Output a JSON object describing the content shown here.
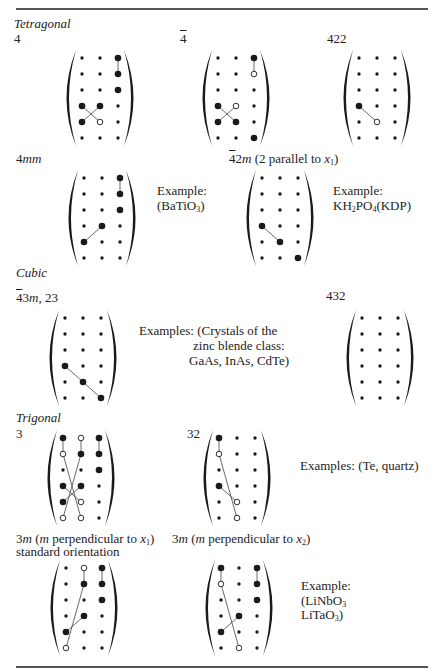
{
  "rules": {
    "color": "#555555",
    "top_y": 8,
    "bottom_y": 666,
    "x1": 16,
    "x2": 428
  },
  "sections": {
    "tetragonal": {
      "title": "Tetragonal"
    },
    "cubic": {
      "title": "Cubic"
    },
    "trigonal": {
      "title": "Trigonal"
    }
  },
  "labels": {
    "c4": [
      {
        "t": "4"
      }
    ],
    "c4bar": [
      {
        "t": "4",
        "bar": true
      }
    ],
    "c422": [
      {
        "t": "422"
      }
    ],
    "c4mm": [
      {
        "t": "4"
      },
      {
        "t": "mm",
        "i": true
      }
    ],
    "c42m": [
      {
        "t": "4",
        "bar": true
      },
      {
        "t": "2"
      },
      {
        "t": "m",
        "i": true
      },
      {
        "t": " (2 parallel to "
      },
      {
        "t": "x",
        "i": true
      },
      {
        "t": "1",
        "sub": true
      },
      {
        "t": ")"
      }
    ],
    "c43m": [
      {
        "t": "4",
        "bar": true
      },
      {
        "t": "3"
      },
      {
        "t": "m",
        "i": true
      },
      {
        "t": ", 23"
      }
    ],
    "c432": [
      {
        "t": "432"
      }
    ],
    "c3": [
      {
        "t": "3"
      }
    ],
    "c32": [
      {
        "t": "32"
      }
    ],
    "c3m1_line1": [
      {
        "t": "3"
      },
      {
        "t": "m",
        "i": true
      },
      {
        "t": " ("
      },
      {
        "t": "m",
        "i": true
      },
      {
        "t": " perpendicular to "
      },
      {
        "t": "x",
        "i": true
      },
      {
        "t": "1",
        "sub": true
      },
      {
        "t": ")"
      }
    ],
    "c3m1_line2": [
      {
        "t": "standard orientation"
      }
    ],
    "c3m2": [
      {
        "t": "3"
      },
      {
        "t": "m",
        "i": true
      },
      {
        "t": " ("
      },
      {
        "t": "m",
        "i": true
      },
      {
        "t": " perpendicular to "
      },
      {
        "t": "x",
        "i": true
      },
      {
        "t": "2",
        "sub": true
      },
      {
        "t": ")"
      }
    ]
  },
  "examples": {
    "batio3": {
      "line1": [
        {
          "t": "Example:"
        }
      ],
      "line2": [
        {
          "t": "(BaTiO"
        },
        {
          "t": "3",
          "sub": true
        },
        {
          "t": ")"
        }
      ]
    },
    "kdp": {
      "line1": [
        {
          "t": "Example:"
        }
      ],
      "line2": [
        {
          "t": "KH"
        },
        {
          "t": "2",
          "sub": true
        },
        {
          "t": "PO"
        },
        {
          "t": "4",
          "sub": true
        },
        {
          "t": "(KDP)"
        }
      ]
    },
    "zincblende": {
      "line1": [
        {
          "t": "Examples: (Crystals of the"
        }
      ],
      "line2": [
        {
          "t": "zinc blende class:"
        }
      ],
      "line3": [
        {
          "t": "GaAs, InAs, CdTe)"
        }
      ]
    },
    "te_quartz": {
      "line1": [
        {
          "t": "Examples: (Te, quartz)"
        }
      ]
    },
    "linbo3": {
      "line1": [
        {
          "t": "Example:"
        }
      ],
      "line2": [
        {
          "t": "(LiNbO"
        },
        {
          "t": "3",
          "sub": true
        }
      ],
      "line3": [
        {
          "t": "LiTaO"
        },
        {
          "t": "3",
          "sub": true
        },
        {
          "t": ")"
        }
      ]
    }
  },
  "legend_symbols": {
    "s": "zero element (small dot)",
    "B": "nonzero element (large filled dot)",
    "O": "equal-magnitude opposite-sign element (open circle)"
  },
  "matrix_style": {
    "dot_color": "#1a1a1a",
    "line_color": "#444444",
    "col_spacing": 18,
    "row_spacing": 16
  },
  "matrices": [
    {
      "id": "tetragonal-4",
      "x0": 82,
      "y0": 58,
      "grid": [
        [
          "s",
          "s",
          "B"
        ],
        [
          "s",
          "s",
          "B"
        ],
        [
          "s",
          "s",
          "B"
        ],
        [
          "B",
          "B",
          "s"
        ],
        [
          "B",
          "O",
          "s"
        ],
        [
          "s",
          "s",
          "s"
        ]
      ],
      "lines": [
        [
          [
            0,
            2
          ],
          [
            1,
            2
          ]
        ],
        [
          [
            3,
            0
          ],
          [
            4,
            1
          ]
        ],
        [
          [
            3,
            1
          ],
          [
            4,
            0
          ]
        ]
      ]
    },
    {
      "id": "tetragonal-4bar",
      "x0": 218,
      "y0": 58,
      "grid": [
        [
          "s",
          "s",
          "B"
        ],
        [
          "s",
          "s",
          "O"
        ],
        [
          "s",
          "s",
          "s"
        ],
        [
          "B",
          "O",
          "s"
        ],
        [
          "B",
          "B",
          "s"
        ],
        [
          "s",
          "s",
          "B"
        ]
      ],
      "lines": [
        [
          [
            0,
            2
          ],
          [
            1,
            2
          ]
        ],
        [
          [
            3,
            0
          ],
          [
            4,
            1
          ]
        ],
        [
          [
            3,
            1
          ],
          [
            4,
            0
          ]
        ]
      ]
    },
    {
      "id": "tetragonal-422",
      "x0": 359,
      "y0": 58,
      "grid": [
        [
          "s",
          "s",
          "s"
        ],
        [
          "s",
          "s",
          "s"
        ],
        [
          "s",
          "s",
          "s"
        ],
        [
          "B",
          "s",
          "s"
        ],
        [
          "s",
          "O",
          "s"
        ],
        [
          "s",
          "s",
          "s"
        ]
      ],
      "lines": [
        [
          [
            3,
            0
          ],
          [
            4,
            1
          ]
        ]
      ]
    },
    {
      "id": "tetragonal-4mm",
      "x0": 84,
      "y0": 178,
      "grid": [
        [
          "s",
          "s",
          "B"
        ],
        [
          "s",
          "s",
          "B"
        ],
        [
          "s",
          "s",
          "B"
        ],
        [
          "s",
          "B",
          "s"
        ],
        [
          "B",
          "s",
          "s"
        ],
        [
          "s",
          "s",
          "s"
        ]
      ],
      "lines": [
        [
          [
            0,
            2
          ],
          [
            1,
            2
          ]
        ],
        [
          [
            3,
            1
          ],
          [
            4,
            0
          ]
        ]
      ]
    },
    {
      "id": "tetragonal-42m",
      "x0": 262,
      "y0": 178,
      "grid": [
        [
          "s",
          "s",
          "s"
        ],
        [
          "s",
          "s",
          "s"
        ],
        [
          "s",
          "s",
          "s"
        ],
        [
          "B",
          "s",
          "s"
        ],
        [
          "s",
          "B",
          "s"
        ],
        [
          "s",
          "s",
          "B"
        ]
      ],
      "lines": [
        [
          [
            3,
            0
          ],
          [
            4,
            1
          ]
        ]
      ]
    },
    {
      "id": "cubic-43m-23",
      "x0": 65,
      "y0": 318,
      "grid": [
        [
          "s",
          "s",
          "s"
        ],
        [
          "s",
          "s",
          "s"
        ],
        [
          "s",
          "s",
          "s"
        ],
        [
          "B",
          "s",
          "s"
        ],
        [
          "s",
          "B",
          "s"
        ],
        [
          "s",
          "s",
          "B"
        ]
      ],
      "lines": [
        [
          [
            3,
            0
          ],
          [
            4,
            1
          ]
        ],
        [
          [
            4,
            1
          ],
          [
            5,
            2
          ]
        ]
      ]
    },
    {
      "id": "cubic-432",
      "x0": 362,
      "y0": 318,
      "grid": [
        [
          "s",
          "s",
          "s"
        ],
        [
          "s",
          "s",
          "s"
        ],
        [
          "s",
          "s",
          "s"
        ],
        [
          "s",
          "s",
          "s"
        ],
        [
          "s",
          "s",
          "s"
        ],
        [
          "s",
          "s",
          "s"
        ]
      ],
      "lines": []
    },
    {
      "id": "trigonal-3",
      "x0": 63,
      "y0": 438,
      "grid": [
        [
          "B",
          "O",
          "B"
        ],
        [
          "O",
          "B",
          "B"
        ],
        [
          "s",
          "s",
          "B"
        ],
        [
          "B",
          "B",
          "s"
        ],
        [
          "B",
          "O",
          "s"
        ],
        [
          "O",
          "O",
          "s"
        ]
      ],
      "lines": [
        [
          [
            0,
            0
          ],
          [
            1,
            0
          ]
        ],
        [
          [
            0,
            1
          ],
          [
            1,
            1
          ]
        ],
        [
          [
            0,
            2
          ],
          [
            1,
            2
          ]
        ],
        [
          [
            1,
            0
          ],
          [
            5,
            1
          ]
        ],
        [
          [
            1,
            1
          ],
          [
            5,
            0
          ]
        ],
        [
          [
            3,
            0
          ],
          [
            4,
            1
          ]
        ],
        [
          [
            3,
            1
          ],
          [
            4,
            0
          ]
        ]
      ]
    },
    {
      "id": "trigonal-32",
      "x0": 219,
      "y0": 438,
      "grid": [
        [
          "B",
          "s",
          "s"
        ],
        [
          "O",
          "s",
          "s"
        ],
        [
          "s",
          "s",
          "s"
        ],
        [
          "B",
          "s",
          "s"
        ],
        [
          "s",
          "O",
          "s"
        ],
        [
          "s",
          "O",
          "s"
        ]
      ],
      "lines": [
        [
          [
            0,
            0
          ],
          [
            1,
            0
          ]
        ],
        [
          [
            1,
            0
          ],
          [
            5,
            1
          ]
        ],
        [
          [
            3,
            0
          ],
          [
            4,
            1
          ]
        ]
      ]
    },
    {
      "id": "trigonal-3m-perp-x1",
      "x0": 66,
      "y0": 568,
      "grid": [
        [
          "s",
          "O",
          "B"
        ],
        [
          "s",
          "B",
          "B"
        ],
        [
          "s",
          "s",
          "B"
        ],
        [
          "s",
          "B",
          "s"
        ],
        [
          "B",
          "s",
          "s"
        ],
        [
          "O",
          "s",
          "s"
        ]
      ],
      "lines": [
        [
          [
            0,
            1
          ],
          [
            1,
            1
          ]
        ],
        [
          [
            0,
            2
          ],
          [
            1,
            2
          ]
        ],
        [
          [
            1,
            1
          ],
          [
            5,
            0
          ]
        ],
        [
          [
            3,
            1
          ],
          [
            4,
            0
          ]
        ]
      ]
    },
    {
      "id": "trigonal-3m-perp-x2",
      "x0": 221,
      "y0": 568,
      "grid": [
        [
          "B",
          "s",
          "B"
        ],
        [
          "O",
          "s",
          "B"
        ],
        [
          "s",
          "s",
          "B"
        ],
        [
          "s",
          "B",
          "s"
        ],
        [
          "B",
          "s",
          "s"
        ],
        [
          "s",
          "O",
          "s"
        ]
      ],
      "lines": [
        [
          [
            0,
            0
          ],
          [
            1,
            0
          ]
        ],
        [
          [
            0,
            2
          ],
          [
            1,
            2
          ]
        ],
        [
          [
            1,
            0
          ],
          [
            5,
            1
          ]
        ],
        [
          [
            3,
            1
          ],
          [
            4,
            0
          ]
        ]
      ]
    }
  ]
}
